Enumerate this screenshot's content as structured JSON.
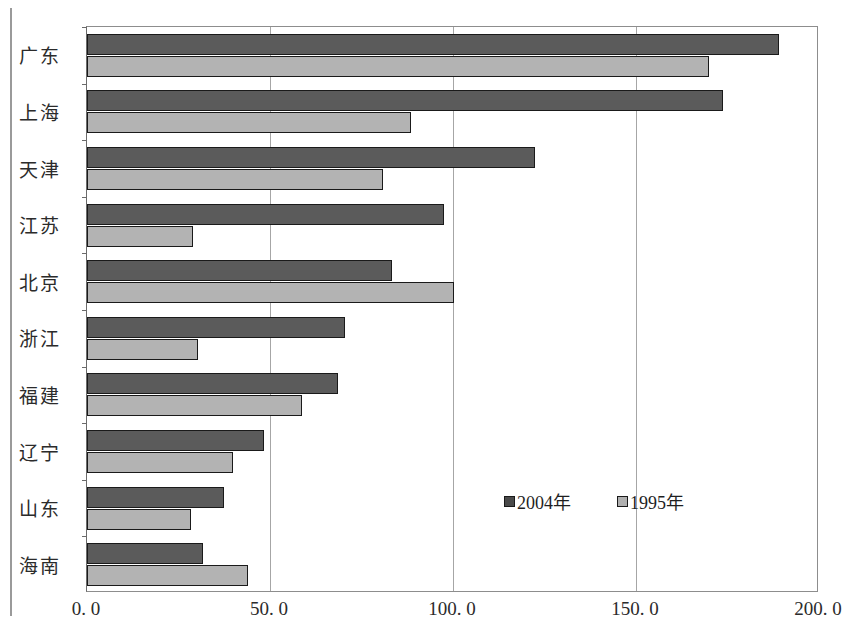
{
  "chart_data": {
    "type": "bar",
    "orientation": "horizontal",
    "title": "",
    "xlabel": "",
    "ylabel": "",
    "xlim": [
      0,
      200
    ],
    "grid": true,
    "legend_position": "inside-bottom-right",
    "xticks": [
      "0. 0",
      "50. 0",
      "100. 0",
      "150. 0",
      "200. 0"
    ],
    "xtick_values": [
      0,
      50,
      100,
      150,
      200
    ],
    "categories": [
      "广东",
      "上海",
      "天津",
      "江苏",
      "北京",
      "浙江",
      "福建",
      "辽宁",
      "山东",
      "海南"
    ],
    "series": [
      {
        "name": "2004年",
        "color": "#5b5b5b",
        "values": [
          189.0,
          173.8,
          122.4,
          97.5,
          83.3,
          70.5,
          68.6,
          48.4,
          37.4,
          31.7
        ]
      },
      {
        "name": "1995年",
        "color": "#b3b3b3",
        "values": [
          170.0,
          88.5,
          81.0,
          29.0,
          100.3,
          30.3,
          58.7,
          39.9,
          28.4,
          44.0
        ]
      }
    ]
  },
  "legend": {
    "items": [
      {
        "label": "2004年",
        "swatch": "dark-gray-square-icon"
      },
      {
        "label": "1995年",
        "swatch": "light-gray-square-icon"
      }
    ]
  }
}
